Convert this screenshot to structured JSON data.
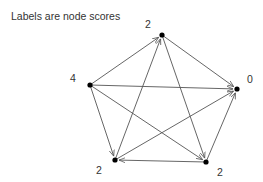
{
  "caption": "Labels are node scores",
  "colors": {
    "edge": "#555555",
    "node": "#000000",
    "text": "#333333"
  },
  "nodes": [
    {
      "id": "top",
      "score": "2",
      "x": 162,
      "y": 35
    },
    {
      "id": "left",
      "score": "4",
      "x": 90,
      "y": 85
    },
    {
      "id": "right",
      "score": "0",
      "x": 237,
      "y": 89
    },
    {
      "id": "bottom_left",
      "score": "2",
      "x": 115,
      "y": 160
    },
    {
      "id": "bottom_right",
      "score": "2",
      "x": 206,
      "y": 162
    }
  ],
  "edges": [
    {
      "from": "left",
      "to": "top"
    },
    {
      "from": "bottom_left",
      "to": "top"
    },
    {
      "from": "top",
      "to": "right"
    },
    {
      "from": "top",
      "to": "bottom_right"
    },
    {
      "from": "left",
      "to": "right"
    },
    {
      "from": "left",
      "to": "bottom_left"
    },
    {
      "from": "left",
      "to": "bottom_right"
    },
    {
      "from": "bottom_left",
      "to": "right"
    },
    {
      "from": "bottom_right",
      "to": "right"
    },
    {
      "from": "bottom_right",
      "to": "bottom_left"
    }
  ]
}
